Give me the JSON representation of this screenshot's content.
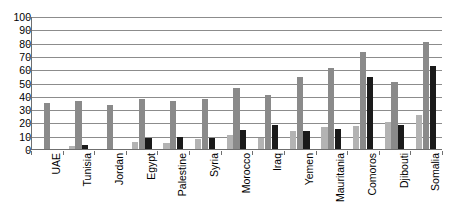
{
  "chart_data": {
    "type": "bar",
    "title": "",
    "subtitle": "",
    "xlabel": "",
    "ylabel": "",
    "ylim": [
      0,
      100
    ],
    "ytick_step": 10,
    "yticks": [
      0,
      10,
      20,
      30,
      40,
      50,
      60,
      70,
      80,
      90,
      100
    ],
    "ytick_labels": [
      "0",
      "10",
      "20",
      "30",
      "40",
      "50",
      "60",
      "70",
      "80",
      "90",
      "100"
    ],
    "grid": true,
    "grid_axis": "y",
    "legend": false,
    "legend_position": "none",
    "categories": [
      "UAE",
      "Tunisia",
      "Jordan",
      "Egypt",
      "Palestine",
      "Syria",
      "Morocco",
      "Iraq",
      "Yemen",
      "Mauritania",
      "Comoros",
      "Djibouti",
      "Somalia"
    ],
    "series": [
      {
        "name": "series-1",
        "color": "#b3b3b3",
        "values": [
          0,
          3,
          0,
          6,
          5,
          8,
          11,
          9,
          14,
          17,
          18,
          21,
          26
        ]
      },
      {
        "name": "series-2",
        "color": "#8a8a8a",
        "values": [
          35,
          37,
          34,
          38,
          37,
          38,
          47,
          41,
          55,
          62,
          74,
          51,
          81
        ]
      },
      {
        "name": "series-3",
        "color": "#1a1a1a",
        "values": [
          0,
          4,
          0,
          9,
          10,
          9,
          15,
          19,
          14,
          16,
          55,
          19,
          63
        ]
      }
    ]
  },
  "axis": {
    "y_min_label": "0",
    "y_max_label": "100"
  }
}
